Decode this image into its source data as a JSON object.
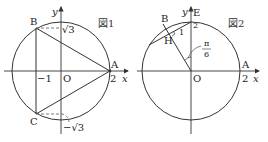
{
  "figure1": {
    "title": "図1",
    "axis_x_label": "x",
    "axis_y_label": "y",
    "origin_label": "O",
    "point_A": "A",
    "point_B": "B",
    "point_C": "C",
    "tick_A": "2",
    "tick_neg1": "−1",
    "tick_sqrt3": "√3",
    "tick_neg_sqrt3": "−√3"
  },
  "figure2": {
    "title": "図2",
    "axis_x_label": "x",
    "axis_y_label": "y",
    "origin_label": "O",
    "point_A": "A",
    "point_B": "B",
    "point_E": "E",
    "point_H": "H",
    "tick_A": "2",
    "tick_E": "2",
    "segment_label": "1",
    "angle_num": "π",
    "angle_den": "6"
  },
  "colors": {
    "line": "#333333",
    "dashed": "#555555"
  }
}
